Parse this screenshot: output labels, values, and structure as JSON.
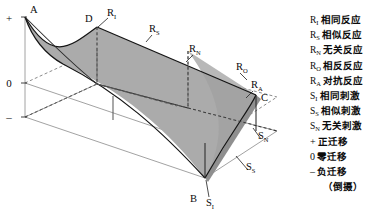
{
  "figure": {
    "title_present": false,
    "axis_marks": [
      {
        "name": "plus",
        "text": "+",
        "x": 12,
        "y": 22
      },
      {
        "name": "zero",
        "text": "0",
        "x": 12,
        "y": 83
      },
      {
        "name": "minus",
        "text": "–",
        "x": 12,
        "y": 117
      }
    ],
    "vertex_labels": [
      {
        "name": "A",
        "base": "A",
        "sub": "",
        "x": 30,
        "y": 13
      },
      {
        "name": "D",
        "base": "D",
        "sub": "",
        "x": 85,
        "y": 22
      },
      {
        "name": "B",
        "base": "B",
        "sub": "",
        "x": 190,
        "y": 202
      },
      {
        "name": "C",
        "base": "C",
        "sub": "",
        "x": 261,
        "y": 101
      }
    ],
    "curve_labels": [
      {
        "name": "R-I",
        "base": "R",
        "sub": "I",
        "x": 111,
        "y": 16
      },
      {
        "name": "R-S",
        "base": "R",
        "sub": "S",
        "x": 153,
        "y": 32
      },
      {
        "name": "R-N",
        "base": "R",
        "sub": "N",
        "x": 193,
        "y": 52
      },
      {
        "name": "R-O",
        "base": "R",
        "sub": "O",
        "x": 238,
        "y": 70
      },
      {
        "name": "R-A",
        "base": "R",
        "sub": "A",
        "x": 253,
        "y": 88
      },
      {
        "name": "S-I",
        "base": "S",
        "sub": "I",
        "x": 210,
        "y": 203
      },
      {
        "name": "S-S",
        "base": "S",
        "sub": "S",
        "x": 250,
        "y": 176
      },
      {
        "name": "S-N",
        "base": "S",
        "sub": "N",
        "x": 262,
        "y": 144
      }
    ],
    "colors": {
      "surface_fill": "#ababab",
      "surface_fill_dark": "#9a9a9a",
      "stroke": "#1a1a1a",
      "frame": "#6b6b6b",
      "dashed": "#4a4a4a",
      "background": "#ffffff"
    }
  },
  "legend": {
    "rows": [
      {
        "name": "legend-r-i",
        "sym": "R",
        "sub": "I",
        "text": "相同反应",
        "indent": false
      },
      {
        "name": "legend-r-s",
        "sym": "R",
        "sub": "S",
        "text": "相似反应",
        "indent": false
      },
      {
        "name": "legend-r-n",
        "sym": "R",
        "sub": "N",
        "text": "无关反应",
        "indent": false
      },
      {
        "name": "legend-r-o",
        "sym": "R",
        "sub": "O",
        "text": "相反反应",
        "indent": false
      },
      {
        "name": "legend-r-a",
        "sym": "R",
        "sub": "A",
        "text": "对抗反应",
        "indent": false
      },
      {
        "name": "legend-s-i",
        "sym": "S",
        "sub": "I",
        "text": "相同刺激",
        "indent": false
      },
      {
        "name": "legend-s-s",
        "sym": "S",
        "sub": "S",
        "text": "相似刺激",
        "indent": false
      },
      {
        "name": "legend-s-n",
        "sym": "S",
        "sub": "N",
        "text": "无关刺激",
        "indent": false
      },
      {
        "name": "legend-plus",
        "sym": "+",
        "sub": "",
        "text": "正迁移",
        "indent": false
      },
      {
        "name": "legend-zero",
        "sym": "0",
        "sub": "",
        "text": "零迁移",
        "indent": false
      },
      {
        "name": "legend-minus",
        "sym": "–",
        "sub": "",
        "text": "负迁移",
        "indent": false
      },
      {
        "name": "legend-note",
        "sym": "",
        "sub": "",
        "text": "（倒摄）",
        "indent": true
      }
    ]
  }
}
